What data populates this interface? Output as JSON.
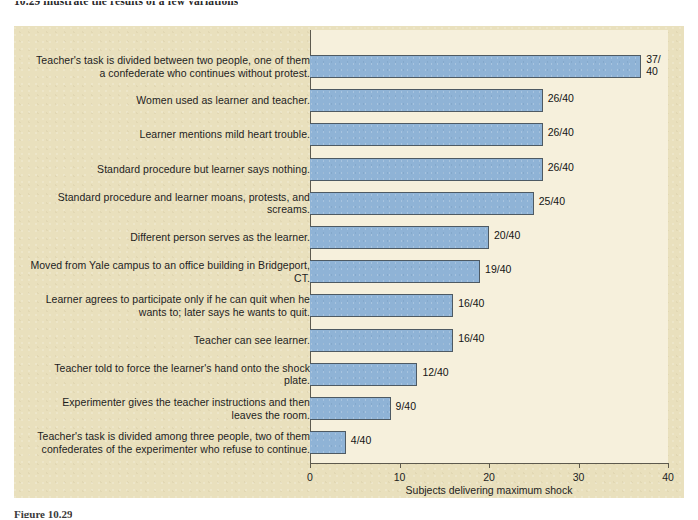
{
  "page": {
    "text_above_figure": "10.29 illustrate the results of a few variations",
    "caption_below_figure": "Figure 10.29"
  },
  "chart_data": {
    "type": "bar",
    "orientation": "horizontal",
    "title": "",
    "xlabel": "Subjects delivering maximum shock",
    "ylabel": "",
    "xlim": [
      0,
      40
    ],
    "xticks": [
      0,
      10,
      20,
      30,
      40
    ],
    "xtick_labels": [
      "0",
      "10",
      "20",
      "30",
      "40"
    ],
    "grid": false,
    "legend": "none",
    "denominator": 40,
    "bar_color": "#8fb3d6",
    "bar_border_color": "#4e5a63",
    "plot_background": "#f6f0dc",
    "panel_background": "#e9e0bd",
    "categories": [
      "Teacher's task is divided between two people, one of them a confederate who continues without protest.",
      "Women used as learner and teacher.",
      "Learner mentions mild heart trouble.",
      "Standard procedure but learner says nothing.",
      "Standard procedure and learner moans, protests, and screams.",
      "Different person serves as the learner.",
      "Moved from Yale campus to an office building in Bridgeport, CT.",
      "Learner agrees to participate only if he can quit when he wants to; later says he wants to quit.",
      "Teacher can see learner.",
      "Teacher told to force the learner's hand onto the shock plate.",
      "Experimenter gives the teacher instructions and then leaves the room.",
      "Teacher's task is divided among three people, two of  them confederates of the experimenter who refuse to continue."
    ],
    "values": [
      37,
      26,
      26,
      26,
      25,
      20,
      19,
      16,
      16,
      12,
      9,
      4
    ],
    "value_labels": [
      "37/\n40",
      "26/40",
      "26/40",
      "26/40",
      "25/40",
      "20/40",
      "19/40",
      "16/40",
      "16/40",
      "12/40",
      "9/40",
      "4/40"
    ]
  }
}
